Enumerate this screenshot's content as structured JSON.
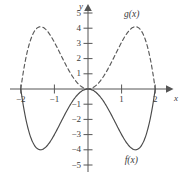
{
  "figure": {
    "title": "",
    "axes": {
      "x_name": "x",
      "y_name": "y"
    },
    "x_ticks": [
      {
        "value": -2,
        "label": "−2"
      },
      {
        "value": -1,
        "label": "−1"
      },
      {
        "value": 1,
        "label": "1"
      },
      {
        "value": 2,
        "label": "2"
      }
    ],
    "y_ticks": [
      {
        "value": 5,
        "label": "5"
      },
      {
        "value": 4,
        "label": "4"
      },
      {
        "value": 3,
        "label": "3"
      },
      {
        "value": 2,
        "label": "2"
      },
      {
        "value": 1,
        "label": "1"
      },
      {
        "value": -1,
        "label": "−1"
      },
      {
        "value": -2,
        "label": "−2"
      },
      {
        "value": -3,
        "label": "−3"
      },
      {
        "value": -4,
        "label": "−4"
      },
      {
        "value": -5,
        "label": "−5"
      }
    ],
    "curve_labels": {
      "g": "g(x)",
      "f": "f(x)"
    },
    "colors": {
      "axis": "#555555",
      "curve_f": "#4a4a4a",
      "curve_g": "#5a5a5a",
      "text": "#3b3b3b"
    }
  },
  "chart_data": {
    "type": "line",
    "title": "",
    "xlabel": "x",
    "ylabel": "y",
    "xlim": [
      -2.3,
      2.35
    ],
    "ylim": [
      -5.6,
      5.7
    ],
    "grid": false,
    "legend": "inline-curve-labels",
    "xticks": [
      -2,
      -1,
      1,
      2
    ],
    "yticks": [
      5,
      4,
      3,
      2,
      1,
      -1,
      -2,
      -3,
      -4,
      -5
    ],
    "series": [
      {
        "name": "f(x)",
        "style": "solid",
        "color": "#4a4a4a",
        "label_at": {
          "x": 1.45,
          "y": -4.75
        },
        "roots": [
          -2,
          0,
          2
        ],
        "extrema": [
          {
            "x": -1.41,
            "y": -4.0,
            "kind": "minimum"
          },
          {
            "x": 1.41,
            "y": -4.0,
            "kind": "minimum"
          },
          {
            "x": 0,
            "y": 0,
            "kind": "maximum"
          }
        ],
        "x": [
          -2.0,
          -1.9,
          -1.8,
          -1.7,
          -1.6,
          -1.5,
          -1.4,
          -1.3,
          -1.2,
          -1.1,
          -1.0,
          -0.9,
          -0.8,
          -0.7,
          -0.6,
          -0.5,
          -0.4,
          -0.3,
          -0.2,
          -0.1,
          0.0,
          0.1,
          0.2,
          0.3,
          0.4,
          0.5,
          0.6,
          0.7,
          0.8,
          0.9,
          1.0,
          1.1,
          1.2,
          1.3,
          1.4,
          1.5,
          1.6,
          1.7,
          1.8,
          1.9,
          2.0
        ],
        "y": [
          0.0,
          -1.44,
          -2.55,
          -3.36,
          -3.9,
          -4.0,
          -4.0,
          -3.84,
          -3.46,
          -2.96,
          -3.0,
          -2.47,
          -1.92,
          -1.4,
          -0.96,
          -0.65,
          -0.39,
          -0.2,
          -0.08,
          -0.02,
          0.0,
          -0.02,
          -0.08,
          -0.2,
          -0.39,
          -0.65,
          -0.96,
          -1.4,
          -1.92,
          -2.47,
          -3.0,
          -3.46,
          -3.84,
          -4.0,
          -4.0,
          -3.9,
          -3.36,
          -2.55,
          -1.44,
          -0.75,
          0.0
        ]
      },
      {
        "name": "g(x)",
        "style": "dashed",
        "color": "#5a5a5a",
        "label_at": {
          "x": 1.25,
          "y": 4.85
        },
        "roots": [
          -2,
          0,
          2
        ],
        "extrema": [
          {
            "x": -1.41,
            "y": 4.1,
            "kind": "maximum"
          },
          {
            "x": 1.41,
            "y": 4.1,
            "kind": "maximum"
          },
          {
            "x": 0,
            "y": 0,
            "kind": "minimum"
          }
        ],
        "x": [
          -2.0,
          -1.9,
          -1.8,
          -1.7,
          -1.6,
          -1.5,
          -1.4,
          -1.3,
          -1.2,
          -1.1,
          -1.0,
          -0.9,
          -0.8,
          -0.7,
          -0.6,
          -0.5,
          -0.4,
          -0.3,
          -0.2,
          -0.1,
          0.0,
          0.1,
          0.2,
          0.3,
          0.4,
          0.5,
          0.6,
          0.7,
          0.8,
          0.9,
          1.0,
          1.1,
          1.2,
          1.3,
          1.4,
          1.5,
          1.6,
          1.7,
          1.8,
          1.9,
          2.0
        ],
        "y": [
          0.0,
          1.48,
          2.62,
          3.45,
          3.95,
          4.1,
          4.1,
          3.94,
          3.55,
          3.04,
          3.0,
          2.47,
          1.92,
          1.4,
          0.96,
          0.65,
          0.39,
          0.2,
          0.08,
          0.02,
          0.0,
          0.02,
          0.08,
          0.2,
          0.39,
          0.65,
          0.96,
          1.4,
          1.92,
          2.47,
          3.0,
          3.55,
          3.94,
          4.1,
          4.1,
          3.95,
          3.45,
          2.62,
          1.48,
          0.77,
          0.0
        ]
      }
    ]
  }
}
